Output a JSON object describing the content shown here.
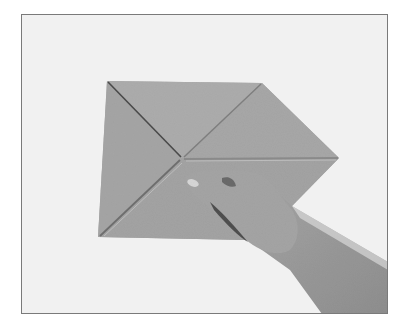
{
  "image": {
    "description": "Grayscale photograph of an origami folding step: a square sheet folded with diagonal creases, a hand pressing a crease near the center",
    "width": 406,
    "height": 331
  },
  "colors": {
    "outer_background": "#ffffff",
    "photo_background": "#f1f1f1",
    "frame_border": "#7a7a7a",
    "paper": "#a9a9a9",
    "paper_shadow": "#9c9c9c",
    "crease_dark": "#4a4a4a",
    "crease_light": "#bdbdbd",
    "skin": "#a2a2a2",
    "skin_shadow": "#5a5a5a",
    "fingernail": "#d6d6d6"
  },
  "geometry": {
    "frame": {
      "x": 21,
      "y": 14,
      "w": 367,
      "h": 300
    },
    "paper_corners": {
      "top_left": [
        107,
        81
      ],
      "top_right": [
        262,
        83
      ],
      "right_point": [
        339,
        158
      ],
      "bottom_left": [
        98,
        237
      ],
      "center": [
        182,
        158
      ]
    }
  }
}
